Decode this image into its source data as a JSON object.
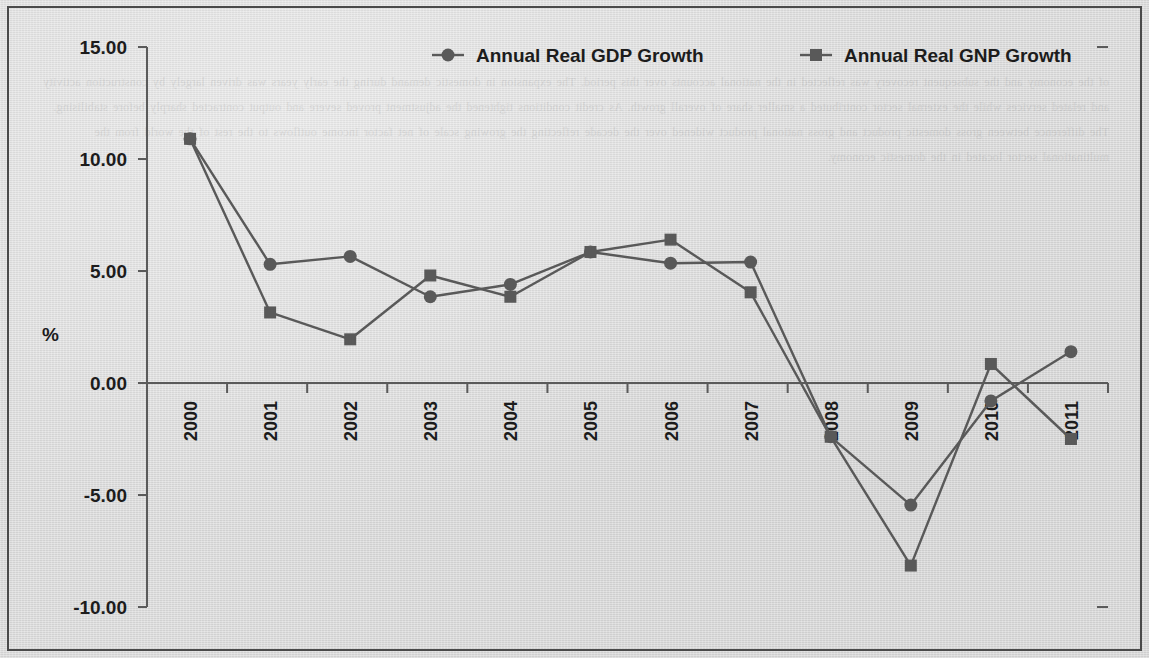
{
  "figure": {
    "background_color": "#d9d9d9",
    "border_color": "#4a4a4a",
    "series_color": "#595959",
    "text_color": "#1c1c1c"
  },
  "legend": {
    "position": "top",
    "entries": [
      {
        "label": "Annual Real GDP Growth",
        "marker": "circle-marker"
      },
      {
        "label": "Annual Real GNP Growth",
        "marker": "square-marker"
      }
    ]
  },
  "axes": {
    "ylabel": "%",
    "ytick_labels": [
      "15.00",
      "10.00",
      "5.00",
      "0.00",
      "-5.00",
      "-10.00"
    ],
    "ytick_values": [
      15,
      10,
      5,
      0,
      -5,
      -10
    ],
    "xtick_labels": [
      "2000",
      "2001",
      "2002",
      "2003",
      "2004",
      "2005",
      "2006",
      "2007",
      "2008",
      "2009",
      "2010",
      "2011"
    ],
    "xlabel": ""
  },
  "chart_data": {
    "type": "line",
    "title": "",
    "xlabel": "",
    "ylabel": "%",
    "x": [
      2000,
      2001,
      2002,
      2003,
      2004,
      2005,
      2006,
      2007,
      2008,
      2009,
      2010,
      2011
    ],
    "categories": [
      "2000",
      "2001",
      "2002",
      "2003",
      "2004",
      "2005",
      "2006",
      "2007",
      "2008",
      "2009",
      "2010",
      "2011"
    ],
    "ylim": [
      -10,
      15
    ],
    "yticks": [
      -10,
      -5,
      0,
      5,
      10,
      15
    ],
    "grid": false,
    "legend_position": "top",
    "series": [
      {
        "name": "Annual Real GDP Growth",
        "marker": "circle",
        "color": "#595959",
        "values": [
          10.9,
          5.3,
          5.65,
          3.85,
          4.4,
          5.85,
          5.35,
          5.4,
          -2.4,
          -5.45,
          -0.8,
          1.4
        ]
      },
      {
        "name": "Annual Real GNP Growth",
        "marker": "square",
        "color": "#595959",
        "values": [
          10.9,
          3.15,
          1.95,
          4.8,
          3.85,
          5.85,
          6.4,
          4.05,
          -2.4,
          -8.15,
          0.85,
          -2.5
        ]
      }
    ]
  },
  "bleed_text": "of the economy and the subsequent recovery was reflected in the national accounts over this period. The expansion in domestic demand during the early years was driven largely by construction activity and related services while the external sector contributed a smaller share of overall growth. As credit conditions tightened the adjustment proved severe and output contracted sharply before stabilising. The difference between gross domestic product and gross national product widened over the decade reflecting the growing scale of net factor income outflows to the rest of the world from the multinational sector located in the domestic economy."
}
